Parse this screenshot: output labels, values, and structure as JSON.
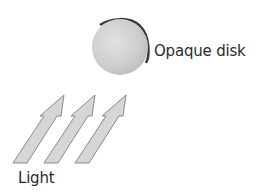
{
  "diagram": {
    "labels": {
      "disk": "Opaque disk",
      "light": "Light"
    },
    "colors": {
      "background": "#ffffff",
      "disk_face": "#cfcfcf",
      "disk_rim": "#3a3a3a",
      "arrow_fill": "#d6d6d6",
      "arrow_stroke": "#8a8a8a",
      "text": "#2a2a2a"
    },
    "elements": [
      {
        "type": "disk",
        "label": "Opaque disk"
      },
      {
        "type": "arrow",
        "count": 3,
        "direction": "up-right",
        "label": "Light"
      }
    ]
  }
}
